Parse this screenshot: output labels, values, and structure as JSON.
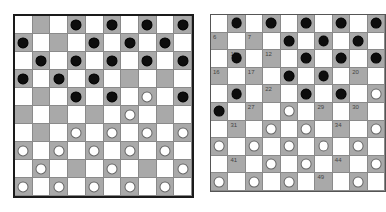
{
  "colors": {
    "light_square": "#ffffff",
    "dark_square": "#a9a9a9",
    "black_piece": "#0d0d0d",
    "white_piece": "#ffffff"
  },
  "legend": {
    "B": "black piece",
    "W": "white piece",
    ".": "empty"
  },
  "boards": [
    {
      "name": "left-board",
      "rows": [
        ".  . . B . B . B . B",
        "B . . . B . B . B .",
        ". B . B . B . B . B",
        "B . B . B . . . . .",
        ". . . B . B . W . B",
        ". . . . . . W . . .",
        ". . . W . W . W . W",
        "W . W . W . W . W .",
        ". W . . . W . . . W",
        "W . W . W . W . W ."
      ]
    },
    {
      "name": "right-board",
      "rows": [
        ". B . B . B . B . B",
        ". . . . B . B . B .",
        ". B . . . B . B . B",
        ". . . . B . B . . .",
        ". B . . . B . B . W",
        "B . . . W . . . . .",
        ". . . W . W . . . W",
        "W . W . W . W . W .",
        ". . . W . W . . . W",
        "W . W . W . . . W ."
      ],
      "numbers": {
        "1,0": "6",
        "1,2": "7",
        "2,1": "11",
        "2,3": "12",
        "3,0": "16",
        "3,2": "17",
        "3,8": "20",
        "4,3": "22",
        "5,2": "27",
        "5,6": "29",
        "5,8": "30",
        "6,1": "31",
        "6,7": "34",
        "8,1": "41",
        "8,7": "44",
        "9,6": "49"
      }
    }
  ]
}
